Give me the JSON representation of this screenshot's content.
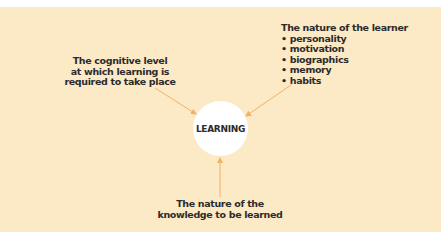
{
  "diagram": {
    "center": {
      "label": "LEARNING"
    },
    "factors": {
      "cognitive": {
        "lines": [
          "The cognitive level",
          "at which learning is",
          "required to take place"
        ]
      },
      "learner": {
        "title": "The nature of the learner",
        "items": [
          "personality",
          "motivation",
          "biographics",
          "memory",
          "habits"
        ]
      },
      "knowledge": {
        "lines": [
          "The nature of the",
          "knowledge to be learned"
        ]
      }
    },
    "colors": {
      "background": "#fce9c6",
      "arrow": "#f0b265",
      "circle": "#ffffff",
      "text": "#2b2b2b"
    }
  }
}
